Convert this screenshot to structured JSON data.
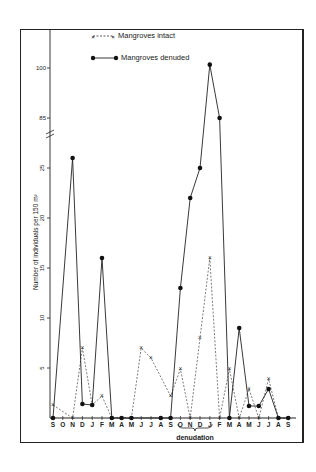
{
  "chart_data": {
    "type": "line",
    "title": "",
    "xlabel": "",
    "ylabel": "Number of individuals per 150 m²",
    "annotation": "denudation",
    "annotation_span": [
      "O",
      "D"
    ],
    "y_axis": {
      "lower_segment": {
        "range": [
          0,
          25
        ],
        "ticks": [
          5,
          10,
          15,
          20,
          25
        ]
      },
      "axis_break": true,
      "upper_segment": {
        "ticks": [
          85,
          100
        ]
      }
    },
    "categories": [
      "S",
      "O",
      "N",
      "D",
      "J",
      "F",
      "M",
      "A",
      "M",
      "J",
      "J",
      "A",
      "S",
      "O",
      "N",
      "D",
      "J",
      "F",
      "M",
      "A",
      "M",
      "J",
      "J",
      "A",
      "S"
    ],
    "series": [
      {
        "name": "Mangroves intact",
        "style": "dashed line, x markers",
        "values": [
          1.3,
          null,
          0,
          7,
          1.3,
          2.2,
          0,
          0,
          0,
          7,
          6,
          null,
          2.2,
          4.9,
          0,
          8,
          16,
          0,
          4.9,
          0,
          2.9,
          0,
          3.9,
          0,
          0
        ]
      },
      {
        "name": "Mangroves denuded",
        "style": "solid line, filled circle markers",
        "values": [
          0,
          null,
          26,
          1.4,
          1.3,
          16,
          0,
          0,
          0,
          null,
          null,
          0,
          0,
          13,
          22,
          25,
          101,
          85,
          0,
          9,
          1.2,
          1.2,
          2.9,
          0,
          0
        ]
      }
    ],
    "legend_position": "top-left inside"
  },
  "legend": {
    "intact": "Mangroves  intact",
    "denuded": "Mangroves  denuded"
  },
  "axis": {
    "ylabel": "Number of individuals per 150 m²",
    "ticks_lower": [
      "5",
      "10",
      "15",
      "20",
      "25"
    ],
    "ticks_upper": [
      "85",
      "100"
    ],
    "months": [
      "S",
      "O",
      "N",
      "D",
      "J",
      "F",
      "M",
      "A",
      "M",
      "J",
      "J",
      "A",
      "S",
      "O",
      "N",
      "D",
      "J",
      "F",
      "M",
      "A",
      "M",
      "J",
      "J",
      "A",
      "S"
    ],
    "annotation": "denudation"
  }
}
